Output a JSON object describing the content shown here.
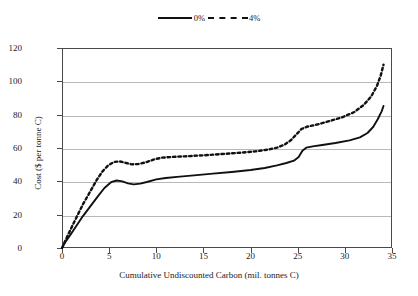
{
  "legend": {
    "position": "top-center",
    "entries": [
      {
        "label": "0%",
        "style": "solid"
      },
      {
        "label": "4%",
        "style": "dashed"
      }
    ]
  },
  "chart_data": {
    "type": "line",
    "title": "",
    "xlabel": "Cumulative Undiscounted Carbon (mil. tonnes C)",
    "ylabel": "Cost ($ per tonne C)",
    "xlim": [
      0,
      35
    ],
    "ylim": [
      0,
      120
    ],
    "xticks": [
      0,
      5,
      10,
      15,
      20,
      25,
      30,
      35
    ],
    "yticks": [
      0,
      20,
      40,
      60,
      80,
      100,
      120
    ],
    "grid": "horizontal",
    "legend_position": "top-center",
    "series": [
      {
        "name": "0%",
        "style": "solid",
        "color": "#111111",
        "points": [
          [
            0.0,
            0
          ],
          [
            0.4,
            4
          ],
          [
            0.9,
            8
          ],
          [
            1.5,
            13
          ],
          [
            2.2,
            19
          ],
          [
            3.0,
            25
          ],
          [
            3.8,
            31
          ],
          [
            4.5,
            36
          ],
          [
            5.2,
            39.5
          ],
          [
            5.8,
            40.5
          ],
          [
            6.4,
            40
          ],
          [
            7.0,
            38.8
          ],
          [
            7.6,
            38.2
          ],
          [
            8.3,
            38.6
          ],
          [
            9.0,
            39.6
          ],
          [
            10.0,
            41.2
          ],
          [
            11.0,
            42.0
          ],
          [
            12.5,
            42.8
          ],
          [
            14.0,
            43.6
          ],
          [
            16.0,
            44.6
          ],
          [
            18.0,
            45.6
          ],
          [
            20.0,
            46.8
          ],
          [
            21.5,
            48.0
          ],
          [
            22.8,
            49.6
          ],
          [
            23.8,
            51.0
          ],
          [
            24.6,
            52.4
          ],
          [
            25.1,
            54.6
          ],
          [
            25.5,
            58.4
          ],
          [
            25.9,
            60.2
          ],
          [
            26.6,
            61.0
          ],
          [
            27.6,
            61.8
          ],
          [
            29.0,
            63.0
          ],
          [
            30.5,
            64.6
          ],
          [
            31.6,
            66.4
          ],
          [
            32.4,
            69.0
          ],
          [
            33.0,
            72.6
          ],
          [
            33.5,
            77.4
          ],
          [
            33.9,
            82.0
          ],
          [
            34.1,
            85.2
          ]
        ]
      },
      {
        "name": "4%",
        "style": "dashed",
        "color": "#111111",
        "points": [
          [
            0.0,
            0
          ],
          [
            0.4,
            5
          ],
          [
            0.9,
            11
          ],
          [
            1.5,
            18
          ],
          [
            2.2,
            26
          ],
          [
            3.0,
            34
          ],
          [
            3.7,
            41
          ],
          [
            4.3,
            46
          ],
          [
            4.9,
            49.6
          ],
          [
            5.5,
            51.6
          ],
          [
            6.1,
            52.0
          ],
          [
            6.8,
            51.0
          ],
          [
            7.4,
            50.2
          ],
          [
            8.1,
            50.4
          ],
          [
            8.9,
            51.4
          ],
          [
            9.8,
            53.2
          ],
          [
            10.6,
            54.2
          ],
          [
            11.6,
            54.6
          ],
          [
            13.0,
            55.0
          ],
          [
            15.0,
            55.6
          ],
          [
            17.0,
            56.4
          ],
          [
            19.0,
            57.2
          ],
          [
            20.5,
            58.0
          ],
          [
            21.8,
            59.0
          ],
          [
            22.8,
            60.2
          ],
          [
            23.6,
            62.0
          ],
          [
            24.3,
            64.8
          ],
          [
            24.9,
            68.4
          ],
          [
            25.4,
            71.4
          ],
          [
            26.0,
            72.8
          ],
          [
            27.0,
            74.0
          ],
          [
            28.4,
            76.2
          ],
          [
            29.8,
            78.6
          ],
          [
            31.0,
            81.6
          ],
          [
            32.0,
            85.8
          ],
          [
            32.8,
            91.0
          ],
          [
            33.4,
            97.2
          ],
          [
            33.8,
            103.4
          ],
          [
            34.1,
            110.0
          ]
        ]
      }
    ]
  }
}
